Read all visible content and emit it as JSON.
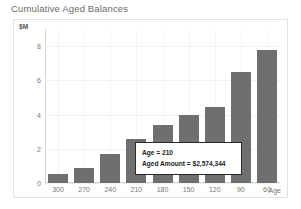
{
  "chart_title": "Cumulative Aged Balances",
  "y_unit_label": "$M",
  "x_axis_title": "Age",
  "tooltip": {
    "line1": "Age = 210",
    "line2": "Aged Amount = $2,574,344"
  },
  "colors": {
    "bar": "#6f6f6f",
    "title_text": "#6a6a6a",
    "tick_text": "#777777",
    "frame_border": "#e2e2e2",
    "gridline": "#f1f1f1",
    "tooltip_border": "#2b2b2b",
    "tooltip_background": "#ffffff",
    "plot_background": "#ffffff"
  },
  "chart_data": {
    "type": "bar",
    "title": "Cumulative Aged Balances",
    "xlabel": "Age",
    "ylabel": "$M",
    "categories": [
      "300",
      "270",
      "240",
      "210",
      "180",
      "150",
      "120",
      "90",
      "60"
    ],
    "values": [
      0.5,
      0.85,
      1.7,
      2.57,
      3.4,
      4.0,
      4.45,
      6.5,
      7.8
    ],
    "ylim": [
      0,
      9
    ],
    "yticks": [
      0,
      2,
      4,
      6,
      8
    ],
    "ytick_labels": [
      "0",
      "2",
      "4",
      "6",
      "8"
    ],
    "grid": true,
    "legend": "none",
    "annotations": [
      {
        "category": "210",
        "text": "Age = 210\nAged Amount = $2,574,344",
        "value_exact": 2574344
      }
    ]
  }
}
